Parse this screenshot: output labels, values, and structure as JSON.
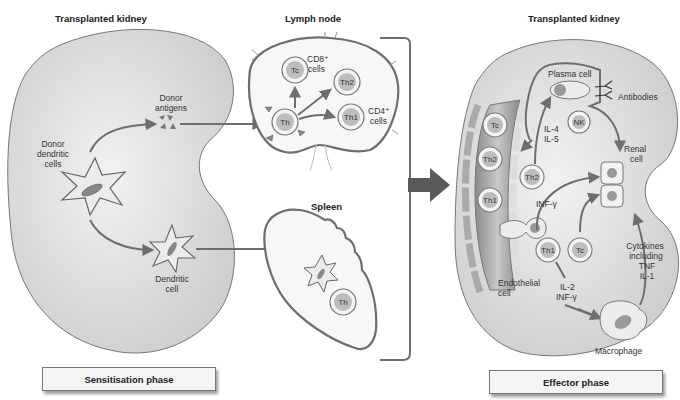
{
  "figure": {
    "left_panel": {
      "title": "Transplanted kidney",
      "labels": {
        "donor_dendritic_cells": [
          "Donor",
          "dendritic",
          "cells"
        ],
        "donor_antigens": [
          "Donor",
          "antigens"
        ],
        "dendritic_cell": [
          "Dendritic",
          "cell"
        ]
      }
    },
    "lymph_node": {
      "title": "Lymph node",
      "cells": {
        "th": "Th",
        "tc": "Tc",
        "th2": "Th2",
        "th1": "Th1"
      },
      "cd8_label": [
        "CD8⁺",
        "cells"
      ],
      "cd4_label": [
        "CD4⁺",
        "cells"
      ]
    },
    "spleen": {
      "title": "Spleen",
      "cells": {
        "th": "Th"
      }
    },
    "right_panel": {
      "title": "Transplanted kidney",
      "cells": {
        "vessel_tc": "Tc",
        "vessel_th2": "Th2",
        "vessel_th1": "Th1",
        "th2": "Th2",
        "nk": "NK",
        "th1": "Th1",
        "tc": "Tc"
      },
      "labels": {
        "plasma_cell": "Plasma cell",
        "antibodies": "Antibodies",
        "il4": "IL-4",
        "il5": "IL-5",
        "renal_cell": [
          "Renal",
          "cell"
        ],
        "inf_gamma": "INF-γ",
        "il2": "IL-2",
        "inf_gamma_2": "INF-γ",
        "cytokines": [
          "Cytokines",
          "including",
          "TNF",
          "IL-1"
        ],
        "endothelial_cell": [
          "Endothelial",
          "cell"
        ],
        "macrophage": "Macrophage"
      }
    },
    "phases": {
      "sensitisation": "Sensitisation phase",
      "effector": "Effector phase"
    },
    "colors": {
      "organ_fill": "#e2e2e2",
      "organ_stroke": "#777777",
      "arrow": "#6e6e6e",
      "cell_nucleus": "#bdbdbd",
      "big_arrow": "#5a5a5a"
    }
  }
}
